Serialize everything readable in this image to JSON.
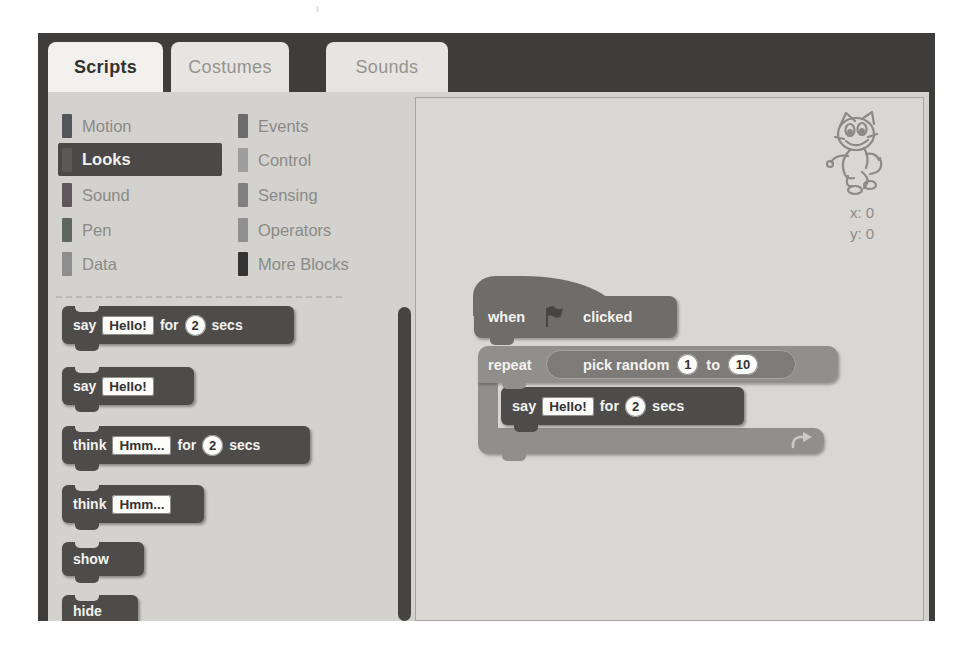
{
  "window": {
    "tabs": [
      {
        "label": "Scripts"
      },
      {
        "label": "Costumes"
      },
      {
        "label": "Sounds"
      }
    ]
  },
  "categories": {
    "column1": [
      {
        "label": "Motion"
      },
      {
        "label": "Looks",
        "selected": true
      },
      {
        "label": "Sound"
      },
      {
        "label": "Pen"
      },
      {
        "label": "Data"
      }
    ],
    "column2": [
      {
        "label": "Events"
      },
      {
        "label": "Control"
      },
      {
        "label": "Sensing"
      },
      {
        "label": "Operators"
      },
      {
        "label": "More Blocks"
      }
    ]
  },
  "palette": {
    "say_for": {
      "t1": "say",
      "field": "Hello!",
      "t2": "for",
      "num": "2",
      "t3": "secs"
    },
    "say": {
      "t1": "say",
      "field": "Hello!"
    },
    "think_for": {
      "t1": "think",
      "field": "Hmm...",
      "t2": "for",
      "num": "2",
      "t3": "secs"
    },
    "think": {
      "t1": "think",
      "field": "Hmm..."
    },
    "show": {
      "t1": "show"
    },
    "hide": {
      "t1": "hide"
    }
  },
  "script_area": {
    "sprite_x": "x: 0",
    "sprite_y": "y: 0",
    "hat": {
      "t1": "when",
      "t2": "clicked"
    },
    "repeat": {
      "t1": "repeat"
    },
    "pick_random": {
      "t1": "pick random",
      "n1": "1",
      "t2": "to",
      "n2": "10"
    },
    "say_for": {
      "t1": "say",
      "field": "Hello!",
      "t2": "for",
      "num": "2",
      "t3": "secs"
    }
  },
  "colors": {
    "frame": "#3f3d3b",
    "palette_bg": "#d3d2cf",
    "script_bg": "#d9d7d4",
    "looks_block": "#4d4c4a",
    "events_hat_block": "#6f6d6a",
    "control_block": "#918f8b",
    "operators_oval": "#7d7b77",
    "selected_category_bg": "#4a4947",
    "active_tab_bg": "#f2f0ed",
    "inactive_tab_bg": "#e7e5e1",
    "swatches": {
      "motion": "#54545b",
      "looks": "#5a5958",
      "sound": "#5e575c",
      "pen": "#5e6662",
      "data": "#8d8d8d",
      "events": "#6c6c6c",
      "control": "#9e9e9e",
      "sensing": "#808080",
      "operators": "#909090",
      "more_blocks": "#343434"
    }
  }
}
